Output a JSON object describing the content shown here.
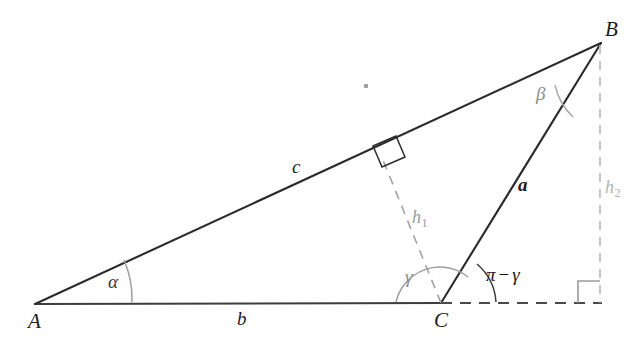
{
  "figure": {
    "background_color": "#ffffff"
  },
  "vertices": {
    "a_label": "A",
    "b_label": "B",
    "c_label": "C"
  },
  "sides": {
    "a_label": "a",
    "b_label": "b",
    "c_label": "c"
  },
  "angles": {
    "alpha_label": "α",
    "beta_label": "β",
    "gamma_label": "γ",
    "supplement_prefix": "π",
    "supplement_minus": "−",
    "supplement_gamma": "γ",
    "supplement_label": "π − γ"
  },
  "heights": {
    "h1_base": "h",
    "h1_sub": "1",
    "h2_base": "h",
    "h2_sub": "2"
  },
  "colors": {
    "stroke_dark": "#2b2b2b",
    "stroke_grey": "#9a9a9a",
    "stroke_light_grey": "#b9b9b9",
    "arc_grey": "#9d9d9d",
    "label_dark": "#1c1c1c",
    "label_grey": "#8d8d8d",
    "label_faint": "#b4b4b4",
    "background": "#ffffff"
  },
  "geometry": {
    "point_A": [
      35,
      304
    ],
    "point_B": [
      601,
      43
    ],
    "point_C": [
      441,
      303
    ],
    "h1_foot_on_AB": [
      383,
      160
    ],
    "h2_foot_on_extension": [
      600,
      303
    ],
    "baseline_y": 303
  },
  "markers": {
    "right_angle_h1": "right-angle-square",
    "right_angle_h2": "right-angle-square"
  }
}
